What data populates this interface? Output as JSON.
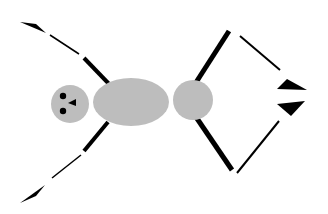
{
  "figure": {
    "colors": {
      "body": "#bdbdbd",
      "stroke": "#000000",
      "background": "#ffffff"
    },
    "parts": [
      "head",
      "thorax",
      "abdomen",
      "left-antenna-upper",
      "left-antenna-lower",
      "right-legs-upper",
      "right-legs-lower"
    ]
  }
}
